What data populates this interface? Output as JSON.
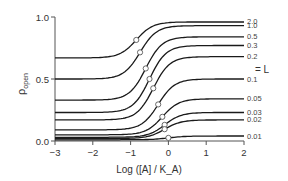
{
  "chart_data": {
    "type": "line",
    "title": "",
    "xlabel": "Log ([A] / K_A)",
    "ylabel": "p_open",
    "xlim": [
      -3,
      2
    ],
    "ylim": [
      0,
      1
    ],
    "xticks": [
      "-3",
      "-2",
      "-1",
      "0",
      "1",
      "2"
    ],
    "yticks": [
      "0.0",
      "0.5",
      "1.0"
    ],
    "grid": false,
    "legend_annotation": "= L",
    "series": [
      {
        "name": "2.0",
        "start": 0.67,
        "end": 0.96,
        "mid_x": -0.85,
        "mid_y": 0.81
      },
      {
        "name": "1.0",
        "start": 0.5,
        "end": 0.93,
        "mid_x": -0.75,
        "mid_y": 0.7
      },
      {
        "name": "0.5",
        "start": 0.33,
        "end": 0.84,
        "mid_x": -0.6,
        "mid_y": 0.59
      },
      {
        "name": "0.3",
        "start": 0.23,
        "end": 0.77,
        "mid_x": -0.5,
        "mid_y": 0.5
      },
      {
        "name": "0.2",
        "start": 0.17,
        "end": 0.68,
        "mid_x": -0.4,
        "mid_y": 0.42
      },
      {
        "name": "0.1",
        "start": 0.09,
        "end": 0.5,
        "mid_x": -0.27,
        "mid_y": 0.3
      },
      {
        "name": "0.05",
        "start": 0.05,
        "end": 0.34,
        "mid_x": -0.16,
        "mid_y": 0.19
      },
      {
        "name": "0.03",
        "start": 0.03,
        "end": 0.23,
        "mid_x": -0.1,
        "mid_y": 0.12
      },
      {
        "name": "0.02",
        "start": 0.02,
        "end": 0.17,
        "mid_x": -0.1,
        "mid_y": 0.08
      },
      {
        "name": "0.01",
        "start": 0.01,
        "end": 0.04,
        "mid_x": 0.0,
        "mid_y": 0.03
      }
    ]
  }
}
